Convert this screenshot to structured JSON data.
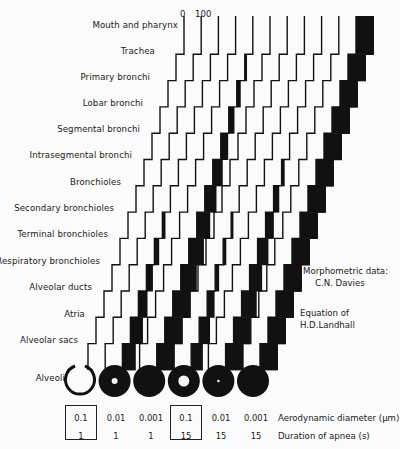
{
  "figure": {
    "scale": {
      "min_label": "0",
      "max_label": "100"
    },
    "rows": [
      "Mouth and pharynx",
      "Trachea",
      "Primary bronchi",
      "Lobar bronchi",
      "Segmental bronchi",
      "Intrasegmental bronchi",
      "Bronchioles",
      "Secondary bronchioles",
      "Terminal bronchioles",
      "Respiratory bronchioles",
      "Alveolar ducts",
      "Atria",
      "Alveolar sacs",
      "Alveoli"
    ],
    "conditions": [
      {
        "diameter": "0.1",
        "apnea": "1",
        "boxed": true,
        "alveolus": "open-ring"
      },
      {
        "diameter": "0.01",
        "apnea": "1",
        "boxed": false,
        "alveolus": "filled-small-hole"
      },
      {
        "diameter": "0.001",
        "apnea": "1",
        "boxed": false,
        "alveolus": "filled"
      },
      {
        "diameter": "0.1",
        "apnea": "15",
        "boxed": true,
        "alveolus": "filled-large-hole"
      },
      {
        "diameter": "0.01",
        "apnea": "15",
        "boxed": false,
        "alveolus": "filled-dot"
      },
      {
        "diameter": "0.001",
        "apnea": "15",
        "boxed": false,
        "alveolus": "filled"
      }
    ],
    "row_labels": {
      "diameter": "Aerodynamic diameter (μm)",
      "apnea": "Duration of apnea (s)"
    },
    "notes": {
      "morphometric_line1": "Morphometric data:",
      "morphometric_line2": "C.N. Davies",
      "equation_line1": "Equation of",
      "equation_line2": "H.D.Landhall"
    }
  },
  "chart_data": {
    "type": "staircase-deposition",
    "title": "",
    "xlabel": "Percent deposited (0–100) per airway generation",
    "categories": [
      "Mouth and pharynx",
      "Trachea",
      "Primary bronchi",
      "Lobar bronchi",
      "Segmental bronchi",
      "Intrasegmental bronchi",
      "Bronchioles",
      "Secondary bronchioles",
      "Terminal bronchioles",
      "Respiratory bronchioles",
      "Alveolar ducts",
      "Atria",
      "Alveolar sacs"
    ],
    "series": [
      {
        "name": "0.1 μm, 1 s",
        "values": [
          0,
          0,
          0,
          0,
          0,
          0,
          0,
          0,
          0,
          0,
          0,
          0,
          0
        ]
      },
      {
        "name": "0.01 μm, 1 s",
        "values": [
          0,
          0,
          0,
          0,
          0,
          0,
          0,
          15,
          25,
          35,
          50,
          70,
          75
        ]
      },
      {
        "name": "0.001 μm, 1 s",
        "values": [
          0,
          10,
          20,
          30,
          40,
          55,
          65,
          75,
          85,
          90,
          100,
          100,
          100
        ]
      },
      {
        "name": "0.1 μm, 15 s",
        "values": [
          0,
          0,
          0,
          0,
          0,
          0,
          0,
          10,
          15,
          20,
          40,
          60,
          65
        ]
      },
      {
        "name": "0.01 μm, 15 s",
        "values": [
          0,
          0,
          0,
          0,
          0,
          15,
          30,
          45,
          60,
          70,
          85,
          95,
          100
        ]
      },
      {
        "name": "0.001 μm, 15 s",
        "values": [
          100,
          100,
          100,
          100,
          100,
          100,
          100,
          100,
          100,
          100,
          100,
          100,
          100
        ]
      }
    ],
    "legend": "none"
  }
}
